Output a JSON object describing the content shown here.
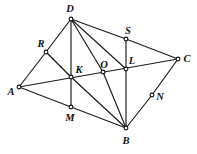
{
  "figure": {
    "width": 197,
    "height": 154,
    "background_color": "#ffffff",
    "line_color": "#1a1a1a",
    "vertex_fill_color": "#ffffff",
    "label_color": "#111111",
    "vertices": [
      {
        "id": "A",
        "label": "A",
        "x": 19,
        "y": 87,
        "label_x": 11,
        "label_y": 92
      },
      {
        "id": "R",
        "label": "R",
        "x": 46,
        "y": 52,
        "label_x": 41,
        "label_y": 44
      },
      {
        "id": "D",
        "label": "D",
        "x": 71,
        "y": 19,
        "label_x": 70,
        "label_y": 9
      },
      {
        "id": "K",
        "label": "K",
        "x": 71,
        "y": 77,
        "label_x": 79,
        "label_y": 70
      },
      {
        "id": "M",
        "label": "M",
        "x": 71,
        "y": 107,
        "label_x": 70,
        "label_y": 118
      },
      {
        "id": "O",
        "label": "O",
        "x": 103,
        "y": 72,
        "label_x": 104,
        "label_y": 65
      },
      {
        "id": "S",
        "label": "S",
        "x": 126,
        "y": 39,
        "label_x": 128,
        "label_y": 31
      },
      {
        "id": "L",
        "label": "L",
        "x": 126,
        "y": 69,
        "label_x": 132,
        "label_y": 61
      },
      {
        "id": "B",
        "label": "B",
        "x": 126,
        "y": 128,
        "label_x": 126,
        "label_y": 141
      },
      {
        "id": "N",
        "label": "N",
        "x": 152,
        "y": 95,
        "label_x": 160,
        "label_y": 97
      },
      {
        "id": "C",
        "label": "C",
        "x": 178,
        "y": 59,
        "label_x": 187,
        "label_y": 59
      }
    ],
    "edges": [
      {
        "from": "A",
        "to": "R"
      },
      {
        "from": "A",
        "to": "C"
      },
      {
        "from": "A",
        "to": "M"
      },
      {
        "from": "R",
        "to": "D"
      },
      {
        "from": "R",
        "to": "K"
      },
      {
        "from": "D",
        "to": "M"
      },
      {
        "from": "D",
        "to": "O"
      },
      {
        "from": "D",
        "to": "L"
      },
      {
        "from": "D",
        "to": "S"
      },
      {
        "from": "S",
        "to": "B"
      },
      {
        "from": "S",
        "to": "C"
      },
      {
        "from": "M",
        "to": "B"
      },
      {
        "from": "K",
        "to": "B"
      },
      {
        "from": "O",
        "to": "B"
      },
      {
        "from": "N",
        "to": "B"
      },
      {
        "from": "C",
        "to": "N"
      }
    ]
  }
}
